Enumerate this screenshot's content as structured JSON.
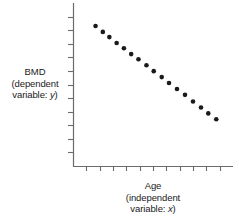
{
  "figure": {
    "background": "#ffffff",
    "ink": "#1a1a1a",
    "axis_color": "#6b6b6b",
    "point_color": "#1a1a1a"
  },
  "y_axis_label": {
    "line1": "BMD",
    "line2": "(dependent",
    "line3_prefix": "variable: ",
    "line3_var": "y",
    "line3_suffix": ")"
  },
  "x_axis_label": {
    "line1": "Age",
    "line2": "(independent",
    "line3_prefix": "variable: ",
    "line3_var": "x",
    "line3_suffix": ")"
  },
  "chart_data": {
    "type": "scatter",
    "title": "",
    "xlabel": "Age (independent variable: x)",
    "ylabel": "BMD (dependent variable: y)",
    "grid": false,
    "legend": "none",
    "tick_labels_shown": false,
    "x_tick_count": 11,
    "y_tick_count": 11,
    "xlim": [
      0,
      11
    ],
    "ylim": [
      0,
      11
    ],
    "trend": "negative linear",
    "n_points": 17,
    "points": [
      {
        "x": 1.55,
        "y": 9.45
      },
      {
        "x": 2.05,
        "y": 9.05
      },
      {
        "x": 2.5,
        "y": 8.7
      },
      {
        "x": 3.0,
        "y": 8.3
      },
      {
        "x": 3.5,
        "y": 7.95
      },
      {
        "x": 4.0,
        "y": 7.55
      },
      {
        "x": 4.5,
        "y": 7.2
      },
      {
        "x": 5.05,
        "y": 6.8
      },
      {
        "x": 5.55,
        "y": 6.4
      },
      {
        "x": 6.1,
        "y": 6.0
      },
      {
        "x": 6.6,
        "y": 5.6
      },
      {
        "x": 7.15,
        "y": 5.2
      },
      {
        "x": 7.7,
        "y": 4.8
      },
      {
        "x": 8.25,
        "y": 4.35
      },
      {
        "x": 8.8,
        "y": 3.95
      },
      {
        "x": 9.3,
        "y": 3.55
      },
      {
        "x": 9.85,
        "y": 3.15
      }
    ]
  },
  "geometry": {
    "origin_x": 73,
    "origin_y": 166,
    "axis_top_y": 3,
    "axis_right_x": 233,
    "plot_left": 73,
    "plot_right": 233,
    "plot_top": 3,
    "plot_bottom": 166,
    "tick_len": 5,
    "point_radius": 2.3
  }
}
